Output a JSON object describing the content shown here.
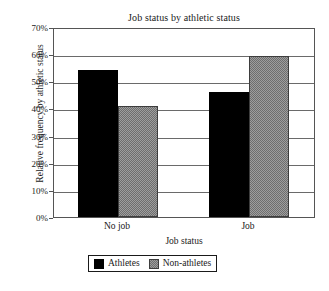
{
  "chart_data": {
    "type": "bar",
    "title": "Job status by athletic status",
    "xlabel": "Job status",
    "ylabel": "Relative frequency by athletic status",
    "categories": [
      "No job",
      "Job"
    ],
    "series": [
      {
        "name": "Athletes",
        "values": [
          54,
          46
        ],
        "color": "#000000"
      },
      {
        "name": "Non-athletes",
        "values": [
          41,
          59.5
        ],
        "color": "#9e9e9e"
      }
    ],
    "ylim": [
      0,
      70
    ],
    "ytick_labels": [
      "0%",
      "10%",
      "20%",
      "30%",
      "40%",
      "50%",
      "60%",
      "70%"
    ],
    "ytick_values": [
      0,
      10,
      20,
      30,
      40,
      50,
      60,
      70
    ],
    "grid": "horizontal",
    "legend_position": "bottom-center"
  }
}
